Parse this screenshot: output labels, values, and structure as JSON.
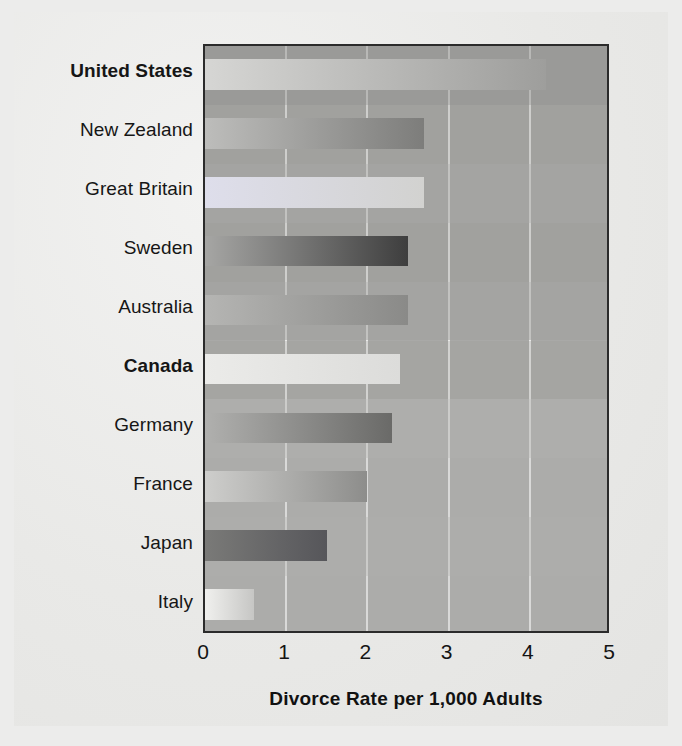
{
  "figure": {
    "background_color": "#ececeb",
    "paper_color": "#e9e9e7",
    "plot_background_color": "#a9a9a7",
    "axis_color": "#2b2b2b",
    "gridline_color": "#f0f0ee"
  },
  "chart_data": {
    "type": "bar",
    "orientation": "horizontal",
    "title": "",
    "subtitle": "",
    "xlabel": "Divorce Rate per 1,000 Adults",
    "ylabel": "",
    "xlim": [
      0,
      5
    ],
    "xticks": [
      "0",
      "1",
      "2",
      "3",
      "4",
      "5"
    ],
    "xtick_values": [
      0,
      1,
      2,
      3,
      4,
      5
    ],
    "grid": true,
    "grid_axis": "x",
    "legend": false,
    "legend_position": "none",
    "categories": [
      "United States",
      "New Zealand",
      "Great Britain",
      "Sweden",
      "Australia",
      "Canada",
      "Germany",
      "France",
      "Japan",
      "Italy"
    ],
    "values": [
      4.2,
      2.7,
      2.7,
      2.5,
      2.5,
      2.4,
      2.3,
      2.0,
      1.5,
      0.6
    ],
    "emphasized_categories": [
      "United States",
      "Canada"
    ],
    "bars": [
      {
        "label": "United States",
        "value": 4.2,
        "emphasis": true,
        "band_color": "#8e8e8c",
        "bar_start_color": "#d6d6d4",
        "bar_end_color": "#9e9e9c"
      },
      {
        "label": "New Zealand",
        "value": 2.7,
        "emphasis": false,
        "band_color": "#8e8e8c",
        "bar_start_color": "#bdbdbb",
        "bar_end_color": "#7d7d7b"
      },
      {
        "label": "Great Britain",
        "value": 2.7,
        "emphasis": false,
        "band_color": "#a0a09e",
        "bar_start_color": "#dedeeb",
        "bar_end_color": "#d2d2d0"
      },
      {
        "label": "Sweden",
        "value": 2.5,
        "emphasis": false,
        "band_color": "#8e8e8c",
        "bar_start_color": "#a6a6a4",
        "bar_end_color": "#3e3e3e"
      },
      {
        "label": "Australia",
        "value": 2.5,
        "emphasis": false,
        "band_color": "#a0a09e",
        "bar_start_color": "#b5b5b3",
        "bar_end_color": "#8a8a88"
      },
      {
        "label": "Canada",
        "value": 2.4,
        "emphasis": true,
        "band_color": "#9a9a98",
        "bar_start_color": "#ebebe9",
        "bar_end_color": "#dcdcda"
      },
      {
        "label": "Germany",
        "value": 2.3,
        "emphasis": false,
        "band_color": "#b2b2b0",
        "bar_start_color": "#b0b0ae",
        "bar_end_color": "#6a6a68"
      },
      {
        "label": "France",
        "value": 2.0,
        "emphasis": false,
        "band_color": "#b4b4b2",
        "bar_start_color": "#cececc",
        "bar_end_color": "#8d8d8b"
      },
      {
        "label": "Japan",
        "value": 1.5,
        "emphasis": false,
        "band_color": "#b0b0ae",
        "bar_start_color": "#7a7a78",
        "bar_end_color": "#56565a"
      },
      {
        "label": "Italy",
        "value": 0.6,
        "emphasis": false,
        "band_color": "#b4b4b2",
        "bar_start_color": "#f0f0ee",
        "bar_end_color": "#c6c6c4"
      }
    ]
  }
}
